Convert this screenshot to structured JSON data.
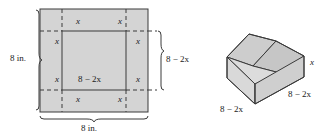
{
  "figure": {
    "colors": {
      "sheet_fill": "#d4d4d4",
      "box_top_face": "#cfcfcf",
      "box_front_face": "#d9d9d9",
      "box_side_face": "#c4c4c4",
      "box_inner_bottom": "#dedede",
      "stroke": "#3a3a3a",
      "text": "#1a1a1a"
    },
    "flat_sheet": {
      "name": "square-sheet",
      "width_label": "8 in.",
      "height_label": "8 in.",
      "corner_cut_label": "x",
      "corner_cut_labels": [
        "x",
        "x",
        "x",
        "x",
        "x",
        "x",
        "x",
        "x"
      ],
      "inner_width_label": "8 − 2x",
      "inner_height_label": "8 − 2x",
      "sheet_side_value": 8,
      "units": "in.",
      "inner_side_expression": "8 − 2x",
      "cut_size_expression": "x"
    },
    "box": {
      "name": "open-top-box",
      "height_label": "x",
      "front_width_label": "8 − 2x",
      "side_depth_label": "8 − 2x",
      "height_expression": "x",
      "base_side_expression": "8 − 2x",
      "open_top": true
    }
  }
}
